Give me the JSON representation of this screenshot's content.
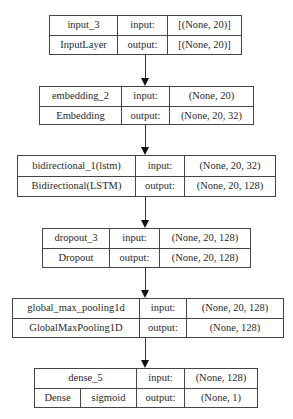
{
  "diagram": {
    "nodes": [
      {
        "name": "input_3",
        "type": "InputLayer",
        "input_label": "input:",
        "input_shape": "[(None, 20)]",
        "output_label": "output:",
        "output_shape": "[(None, 20)]"
      },
      {
        "name": "embedding_2",
        "type": "Embedding",
        "input_label": "input:",
        "input_shape": "(None, 20)",
        "output_label": "output:",
        "output_shape": "(None, 20, 32)"
      },
      {
        "name": "bidirectional_1(lstm)",
        "type": "Bidirectional(LSTM)",
        "input_label": "input:",
        "input_shape": "(None, 20, 32)",
        "output_label": "output:",
        "output_shape": "(None, 20, 128)"
      },
      {
        "name": "dropout_3",
        "type": "Dropout",
        "input_label": "input:",
        "input_shape": "(None, 20, 128)",
        "output_label": "output:",
        "output_shape": "(None, 20, 128)"
      },
      {
        "name": "global_max_pooling1d",
        "type": "GlobalMaxPooling1D",
        "input_label": "input:",
        "input_shape": "(None, 20, 128)",
        "output_label": "output:",
        "output_shape": "(None, 128)"
      },
      {
        "name": "dense_5",
        "type": "Dense",
        "activation": "sigmoid",
        "input_label": "input:",
        "input_shape": "(None, 128)",
        "output_label": "output:",
        "output_shape": "(None, 1)"
      }
    ],
    "edges": [
      {
        "from": "input_3",
        "to": "embedding_2"
      },
      {
        "from": "embedding_2",
        "to": "bidirectional_1(lstm)"
      },
      {
        "from": "bidirectional_1(lstm)",
        "to": "dropout_3"
      },
      {
        "from": "dropout_3",
        "to": "global_max_pooling1d"
      },
      {
        "from": "global_max_pooling1d",
        "to": "dense_5"
      }
    ],
    "colors": {
      "border": "#444444",
      "text": "#2a2a2a",
      "background": "#ffffff",
      "arrow": "#111111"
    }
  }
}
